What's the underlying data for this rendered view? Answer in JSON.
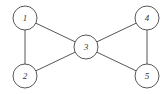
{
  "diagram": {
    "type": "graph",
    "nodes": [
      {
        "id": "1",
        "label": "1",
        "x": 25,
        "y": 18
      },
      {
        "id": "2",
        "label": "2",
        "x": 25,
        "y": 76
      },
      {
        "id": "3",
        "label": "3",
        "x": 86,
        "y": 47
      },
      {
        "id": "4",
        "label": "4",
        "x": 147,
        "y": 18
      },
      {
        "id": "5",
        "label": "5",
        "x": 147,
        "y": 76
      }
    ],
    "edges": [
      [
        "1",
        "2"
      ],
      [
        "1",
        "3"
      ],
      [
        "2",
        "3"
      ],
      [
        "3",
        "4"
      ],
      [
        "3",
        "5"
      ],
      [
        "4",
        "5"
      ]
    ],
    "node_radius": 12,
    "stroke_color": "#444444"
  }
}
